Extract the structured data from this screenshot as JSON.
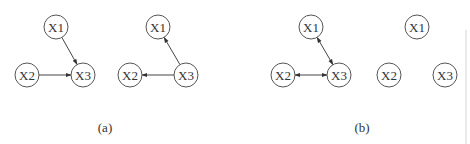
{
  "figure": {
    "panels": [
      {
        "caption": "(a)",
        "graphs": [
          {
            "id": "a1",
            "nodes": [
              "X1",
              "X2",
              "X3"
            ],
            "edges": [
              {
                "from": "X1",
                "to": "X3",
                "type": "directed"
              },
              {
                "from": "X2",
                "to": "X3",
                "type": "directed"
              }
            ]
          },
          {
            "id": "a2",
            "nodes": [
              "X1",
              "X2",
              "X3"
            ],
            "edges": [
              {
                "from": "X3",
                "to": "X1",
                "type": "directed"
              },
              {
                "from": "X3",
                "to": "X2",
                "type": "directed"
              }
            ]
          }
        ]
      },
      {
        "caption": "(b)",
        "graphs": [
          {
            "id": "b1",
            "nodes": [
              "X1",
              "X2",
              "X3"
            ],
            "edges": [
              {
                "from": "X1",
                "to": "X3",
                "type": "bidirected"
              },
              {
                "from": "X2",
                "to": "X3",
                "type": "bidirected"
              }
            ]
          },
          {
            "id": "b2",
            "nodes": [
              "X1",
              "X2",
              "X3"
            ],
            "edges": []
          }
        ]
      }
    ]
  }
}
